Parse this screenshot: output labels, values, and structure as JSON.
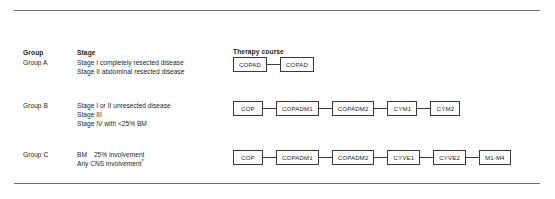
{
  "figure": {
    "headers": {
      "group": "Group",
      "stage": "Stage",
      "therapy": "Therapy course"
    },
    "rows": [
      {
        "group": "Group A",
        "stage_lines": [
          "Stage I completely resected disease",
          "Stage II abdominal resected disease"
        ],
        "therapy_course": [
          "COPAD",
          "COPAD"
        ]
      },
      {
        "group": "Group B",
        "stage_lines": [
          "Stage I or II unresected disease",
          "Stage III",
          "Stage IV with <25% BM"
        ],
        "therapy_course": [
          "COP",
          "COPADM1",
          "COPADM2",
          "CYM1",
          "CYM2"
        ]
      },
      {
        "group": "Group C",
        "stage_lines": [
          "BM  25% involvement",
          "Any CNS involvement*"
        ],
        "therapy_course": [
          "COP",
          "COPADM1",
          "COPADM2",
          "CYVE1",
          "CYVE2",
          "M1-M4"
        ]
      }
    ],
    "colors": {
      "rule": "#6e6e6e",
      "box_border": "#3a3a3a",
      "text": "#231f20",
      "background": "#ffffff"
    }
  }
}
